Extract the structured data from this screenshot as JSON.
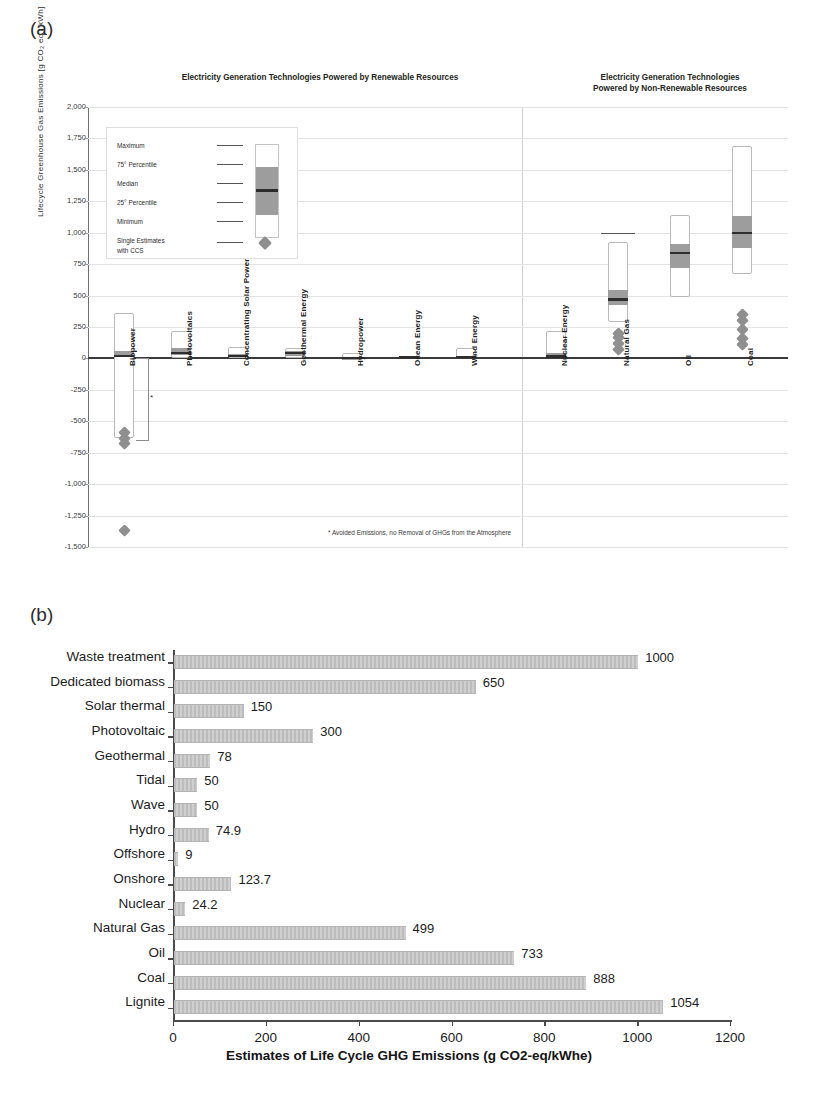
{
  "figure": {
    "panel_a_label": "(a)",
    "panel_b_label": "(b)"
  },
  "chart_data": [
    {
      "type": "box",
      "panel": "(a)",
      "title_left": "Electricity Generation Technologies Powered by Renewable Resources",
      "title_right": "Electricity Generation Technologies Powered by Non-Renewable Resources",
      "title_right_line1": "Electricity Generation Technologies",
      "title_right_line2": "Powered by Non-Renewable Resources",
      "ylabel": "Lifecycle Greenhouse Gas Emissions [g CO₂ eq / kWh]",
      "ylim": [
        -1500,
        2000
      ],
      "ytick_step": 250,
      "yticks": [
        "2,000",
        "1,750",
        "1,500",
        "1,250",
        "1,000",
        "750",
        "500",
        "250",
        "0",
        "-250",
        "-500",
        "-750",
        "-1,000",
        "-1,250",
        "-1,500"
      ],
      "grid": true,
      "footnote": "*  Avoided Emissions, no Removal of GHGs from the Atmosphere",
      "legend": {
        "items": [
          {
            "label": "Maximum"
          },
          {
            "label": "75° Percentile"
          },
          {
            "label": "Median"
          },
          {
            "label": "25° Percentile"
          },
          {
            "label": "Minimum"
          },
          {
            "label": "Single Estimates"
          },
          {
            "label": "with CCS"
          }
        ]
      },
      "groups": [
        {
          "name": "renewable",
          "categories": [
            {
              "label": "Biopower",
              "min": -633,
              "q1": 10,
              "median": 18,
              "q3": 62,
              "max": 360,
              "ccs": [
                -590,
                -640,
                -680
              ],
              "ccs_far": [
                -1370
              ],
              "bracket": true
            },
            {
              "label": "Photovoltaics",
              "min": 5,
              "q1": 29,
              "median": 46,
              "q3": 80,
              "max": 217,
              "ccs": []
            },
            {
              "label": "Concentrating Solar Power",
              "min": 7,
              "q1": 14,
              "median": 22,
              "q3": 32,
              "max": 89,
              "ccs": []
            },
            {
              "label": "Geothermal Energy",
              "min": 6,
              "q1": 20,
              "median": 45,
              "q3": 57,
              "max": 79,
              "ccs": []
            },
            {
              "label": "Hydropower",
              "min": 1,
              "q1": 3,
              "median": 4,
              "q3": 7,
              "max": 43,
              "ccs": []
            },
            {
              "label": "Ocean Energy",
              "min": 2,
              "q1": 5,
              "median": 8,
              "q3": 9,
              "max": 23,
              "ccs": []
            },
            {
              "label": "Wind Energy",
              "min": 2,
              "q1": 8,
              "median": 12,
              "q3": 20,
              "max": 81,
              "ccs": []
            }
          ]
        },
        {
          "name": "non-renewable",
          "categories": [
            {
              "label": "Nuclear Energy",
              "min": 1,
              "q1": 8,
              "median": 16,
              "q3": 45,
              "max": 220,
              "ccs": []
            },
            {
              "label": "Natural Gas",
              "min": 290,
              "q1": 422,
              "median": 469,
              "q3": 548,
              "max": 930,
              "max_sep": 1000,
              "ccs": [
                70,
                120,
                170,
                200
              ]
            },
            {
              "label": "Oil",
              "min": 490,
              "q1": 722,
              "median": 840,
              "q3": 907,
              "max": 1140,
              "ccs": []
            },
            {
              "label": "Coal",
              "min": 675,
              "q1": 877,
              "median": 1001,
              "q3": 1130,
              "max": 1689,
              "ccs": [
                110,
                160,
                230,
                300,
                350
              ]
            }
          ]
        }
      ]
    },
    {
      "type": "bar",
      "panel": "(b)",
      "orientation": "horizontal",
      "title": "",
      "xlabel": "Estimates of Life Cycle  GHG Emissions  (g CO2-eq/kWhe)",
      "ylabel": "",
      "xlim": [
        0,
        1200
      ],
      "xticks": [
        0,
        200,
        400,
        600,
        800,
        1000,
        1200
      ],
      "xtick_labels": [
        "0",
        "200",
        "400",
        "600",
        "800",
        "1000",
        "1200"
      ],
      "grid": false,
      "categories": [
        "Waste treatment",
        "Dedicated biomass",
        "Solar thermal",
        "Photovoltaic",
        "Geothermal",
        "Tidal",
        "Wave",
        "Hydro",
        "Offshore",
        "Onshore",
        "Nuclear",
        "Natural Gas",
        "Oil",
        "Coal",
        "Lignite"
      ],
      "values": [
        1000,
        650,
        150,
        300,
        78,
        50,
        50,
        74.9,
        9,
        123.7,
        24.2,
        499,
        733,
        888,
        1054
      ],
      "value_labels": [
        "1000",
        "650",
        "150",
        "300",
        "78",
        "50",
        "50",
        "74.9",
        "9",
        "123.7",
        "24.2",
        "499",
        "733",
        "888",
        "1054"
      ],
      "bar_color": "#c2c2c2"
    }
  ]
}
